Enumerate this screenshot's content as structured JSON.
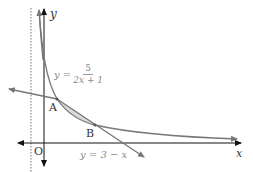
{
  "diagram": {
    "axes": {
      "x_label": "x",
      "y_label": "y",
      "origin_label": "O"
    },
    "asymptote": {
      "x": -0.5,
      "style": "dotted"
    },
    "curve": {
      "equation_lhs": "y =",
      "numerator": "5",
      "denominator": "2x + 1"
    },
    "line": {
      "equation": "y = 3 − x"
    },
    "points": [
      {
        "label": "A",
        "x": 0.5,
        "y": 2.5
      },
      {
        "label": "B",
        "x": 2,
        "y": 1
      }
    ],
    "colors": {
      "axes": "#111111",
      "curve": "#777777",
      "line": "#777777",
      "shaded_region": "#d9d9d9",
      "label_text": "#888888"
    }
  }
}
